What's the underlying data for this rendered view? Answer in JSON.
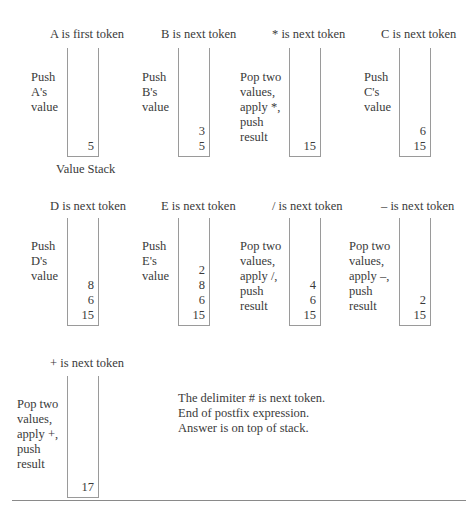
{
  "panels": [
    {
      "title": "A is first token",
      "desc": [
        "Push",
        "A's",
        "value"
      ],
      "stack": [
        "5"
      ]
    },
    {
      "title": "B is next token",
      "desc": [
        "Push",
        "B's",
        "value"
      ],
      "stack": [
        "3",
        "5"
      ]
    },
    {
      "title": "* is next token",
      "desc": [
        "Pop two",
        "values,",
        "apply *,",
        "push",
        "result"
      ],
      "stack": [
        "15"
      ]
    },
    {
      "title": "C is next token",
      "desc": [
        "Push",
        "C's",
        "value"
      ],
      "stack": [
        "6",
        "15"
      ]
    },
    {
      "title": "D is next token",
      "desc": [
        "Push",
        "D's",
        "value"
      ],
      "stack": [
        "8",
        "6",
        "15"
      ]
    },
    {
      "title": "E is next token",
      "desc": [
        "Push",
        "E's",
        "value"
      ],
      "stack": [
        "2",
        "8",
        "6",
        "15"
      ]
    },
    {
      "title": "/ is next token",
      "desc": [
        "Pop two",
        "values,",
        "apply /,",
        "push",
        "result"
      ],
      "stack": [
        "4",
        "6",
        "15"
      ]
    },
    {
      "title": "– is next token",
      "desc": [
        "Pop two",
        "values,",
        "apply –,",
        "push",
        "result"
      ],
      "stack": [
        "2",
        "15"
      ]
    },
    {
      "title": "+ is next token",
      "desc": [
        "Pop two",
        "values,",
        "apply +,",
        "push",
        "result"
      ],
      "stack": [
        "17"
      ]
    }
  ],
  "caption": "Value Stack",
  "final_note": [
    "The delimiter # is next token.",
    "End of postfix expression.",
    "Answer is on top of stack."
  ]
}
